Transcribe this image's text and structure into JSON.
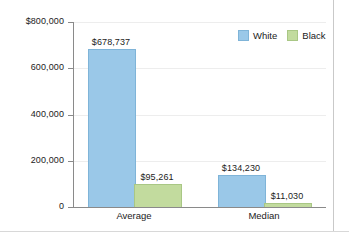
{
  "chart_data": {
    "type": "bar",
    "title": "",
    "subtitle": "",
    "xlabel": "",
    "ylabel": "",
    "categories": [
      "Average",
      "Median"
    ],
    "series": [
      {
        "name": "White",
        "color": "#9ac8e8",
        "values": [
          678737,
          134230
        ],
        "labels": [
          "$678,737",
          "$134,230"
        ]
      },
      {
        "name": "Black",
        "color": "#c2db9e",
        "values": [
          95261,
          11030
        ],
        "labels": [
          "$95,261",
          "$11,030"
        ]
      }
    ],
    "ylim": [
      0,
      800000
    ],
    "yticks": [
      0,
      200000,
      400000,
      600000,
      800000
    ],
    "ytick_labels": [
      "0",
      "200,000",
      "400,000",
      "600,000",
      "$800,000"
    ],
    "grid": true,
    "legend_position": "top-right"
  },
  "legend": {
    "entries": [
      {
        "label": "White",
        "swatch": "legend-swatch-white"
      },
      {
        "label": "Black",
        "swatch": "legend-swatch-black"
      }
    ]
  }
}
